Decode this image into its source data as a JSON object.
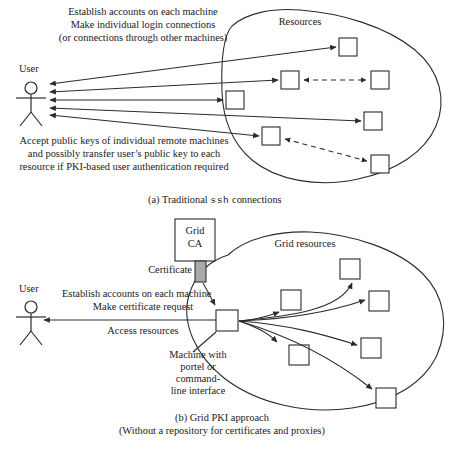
{
  "figure": {
    "background_color": "#ffffff",
    "stroke_color": "#2b2b2b",
    "certificate_fill": "#a8a8a8"
  },
  "panel_a": {
    "caption_prefix": "(a) Traditional ",
    "caption_mono": "ssh",
    "caption_suffix": " connections",
    "user_label": "User",
    "cloud_label": "Resources",
    "top_note": [
      "Establish accounts on each machine",
      "Make individual login connections",
      "(or connections through other machines)"
    ],
    "bottom_note": [
      "Accept public keys of individual remote machines",
      "and possibly transfer user’s public key to each",
      "resource if PKI-based user authentication required"
    ],
    "resource_count": 6,
    "solid_connection_count": 5,
    "dashed_connection_count": 2
  },
  "panel_b": {
    "caption": "(b) Grid PKI approach",
    "caption_sub": "(Without a repository for certificates and proxies)",
    "user_label": "User",
    "cloud_label": "Grid resources",
    "ca_box_label_line1": "Grid",
    "ca_box_label_line2": "CA",
    "certificate_label": "Certificate",
    "user_note": [
      "Establish accounts on each machine",
      "Make certificate request"
    ],
    "access_note": "Access resources",
    "machine_note": [
      "Machine with",
      "portel or",
      "command-",
      "line interface"
    ],
    "resource_count": 6,
    "outgoing_arrow_count": 6
  }
}
